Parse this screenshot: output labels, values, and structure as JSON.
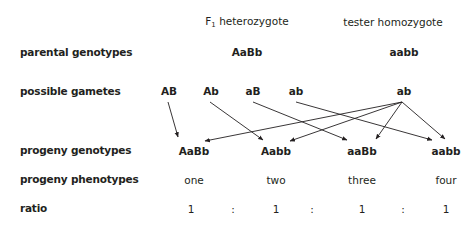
{
  "headers": {
    "f1": {
      "prefix": "F",
      "subscript": "1",
      "suffix": " heterozygote"
    },
    "tester": "tester homozygote"
  },
  "row_labels": {
    "parental_genotypes": "parental genotypes",
    "possible_gametes": "possible gametes",
    "progeny_genotypes": "progeny genotypes",
    "progeny_phenotypes": "progeny phenotypes",
    "ratio": "ratio"
  },
  "parental_genotypes": {
    "f1": "AaBb",
    "tester": "aabb"
  },
  "gametes": {
    "f1": [
      "AB",
      "Ab",
      "aB",
      "ab"
    ],
    "tester": "ab"
  },
  "progeny_genotypes": [
    "AaBb",
    "Aabb",
    "aaBb",
    "aabb"
  ],
  "progeny_phenotypes": [
    "one",
    "two",
    "three",
    "four"
  ],
  "ratio": {
    "values": [
      "1",
      "1",
      "1",
      "1"
    ],
    "separator": ":"
  },
  "arrows": [
    {
      "from": "AB",
      "to": "AaBb"
    },
    {
      "from": "Ab",
      "to": "Aabb"
    },
    {
      "from": "aB",
      "to": "aaBb"
    },
    {
      "from": "ab",
      "to": "aabb"
    },
    {
      "from": "tester-ab",
      "to": "AaBb"
    },
    {
      "from": "tester-ab",
      "to": "Aabb"
    },
    {
      "from": "tester-ab",
      "to": "aaBb"
    },
    {
      "from": "tester-ab",
      "to": "aabb"
    }
  ],
  "colors": {
    "text": "#231f20",
    "line": "#231f20",
    "background": "#ffffff"
  }
}
